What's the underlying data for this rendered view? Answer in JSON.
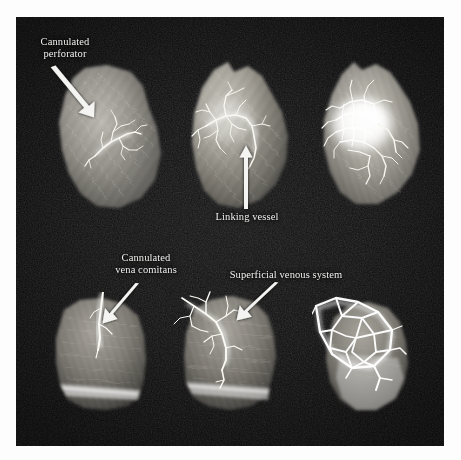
{
  "figure": {
    "kind": "anatomical-angiography-plate",
    "background_color": "#ffffff",
    "plate_color": "#0a0a0b",
    "label_color": "#f2f2f0",
    "arrow_color": "#f4f4f2",
    "rows": 2,
    "columns": 3,
    "specimen_count": 6
  },
  "annotations": [
    {
      "id": "cannulated-perforator",
      "text": "Cannulated\nperforator",
      "label_x": 22,
      "label_y": 36,
      "label_width": 86,
      "arrow": {
        "x1": 57,
        "y1": 67,
        "x2": 94,
        "y2": 114
      }
    },
    {
      "id": "linking-vessel",
      "text": "Linking vessel",
      "label_x": 204,
      "label_y": 211,
      "label_width": 86,
      "arrow": {
        "x1": 246,
        "y1": 209,
        "x2": 246,
        "y2": 152
      }
    },
    {
      "id": "cannulated-vena-comitans",
      "text": "Cannulated\nvena comitans",
      "label_x": 98,
      "label_y": 252,
      "label_width": 96,
      "arrow": {
        "x1": 134,
        "y1": 284,
        "x2": 104,
        "y2": 319
      }
    },
    {
      "id": "superficial-venous-system",
      "text": "Superficial venous system",
      "label_x": 219,
      "label_y": 269,
      "label_width": 134,
      "arrow": {
        "x1": 274,
        "y1": 283,
        "x2": 238,
        "y2": 317
      }
    }
  ],
  "specimens": [
    {
      "id": "top-left",
      "position": "top-left",
      "row": 1,
      "column": 1,
      "description": "tissue flap with small cannulated perforator vessel tree",
      "x": 45,
      "y": 62,
      "width": 135,
      "height": 150,
      "vessel_density": "sparse",
      "vessel_pattern": "small branching tree"
    },
    {
      "id": "top-middle",
      "position": "top-middle",
      "row": 1,
      "column": 2,
      "description": "tissue flap with expanded vessel tree and linking vessel",
      "x": 176,
      "y": 58,
      "width": 136,
      "height": 156,
      "vessel_density": "moderate",
      "vessel_pattern": "branching tree with linking vessel"
    },
    {
      "id": "top-right",
      "position": "top-right",
      "row": 1,
      "column": 3,
      "description": "tissue flap with dense opacified vascular territory",
      "x": 306,
      "y": 58,
      "width": 133,
      "height": 152,
      "vessel_density": "dense",
      "vessel_pattern": "confluent opacified blush"
    },
    {
      "id": "bottom-left",
      "position": "bottom-left",
      "row": 2,
      "column": 1,
      "description": "tissue flap with cannulated vena comitans",
      "x": 40,
      "y": 292,
      "width": 126,
      "height": 122,
      "vessel_density": "sparse",
      "vessel_pattern": "single cannulated vein"
    },
    {
      "id": "bottom-middle",
      "position": "bottom-middle",
      "row": 2,
      "column": 2,
      "description": "tissue flap with filled superficial venous system",
      "x": 172,
      "y": 288,
      "width": 128,
      "height": 126,
      "vessel_density": "moderate",
      "vessel_pattern": "superficial venous branches"
    },
    {
      "id": "bottom-right",
      "position": "bottom-right",
      "row": 2,
      "column": 3,
      "description": "tissue flap with coarse polygonal venous network",
      "x": 312,
      "y": 292,
      "width": 122,
      "height": 122,
      "vessel_density": "dense",
      "vessel_pattern": "polygonal venous mesh"
    }
  ]
}
